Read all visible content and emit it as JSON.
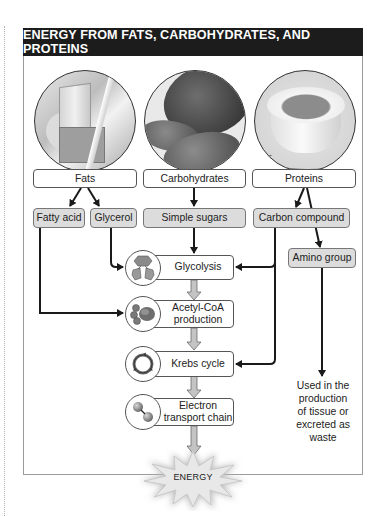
{
  "title": "ENERGY FROM FATS, CARBOHYDRATES, AND PROTEINS",
  "sources": [
    {
      "label": "Fats",
      "image": "butter-photo"
    },
    {
      "label": "Carbohydrates",
      "image": "bread-photo"
    },
    {
      "label": "Proteins",
      "image": "egg-photo"
    }
  ],
  "intermediates": {
    "fatty_acid": "Fatty acid",
    "glycerol": "Glycerol",
    "simple_sugars": "Simple sugars",
    "carbon_compound": "Carbon compound",
    "amino_group": "Amino group"
  },
  "process_steps": [
    {
      "label": "Glycolysis",
      "icon": "glycolysis-icon"
    },
    {
      "label_line1": "Acetyl-CoA",
      "label_line2": "production",
      "icon": "acetyl-coa-icon"
    },
    {
      "label": "Krebs cycle",
      "icon": "krebs-cycle-icon"
    },
    {
      "label_line1": "Electron",
      "label_line2": "transport chain",
      "icon": "electron-transport-icon"
    }
  ],
  "amino_outcome": {
    "line1": "Used in the",
    "line2": "production",
    "line3": "of tissue or",
    "line4": "excreted as",
    "line5": "waste"
  },
  "output": "ENERGY",
  "colors": {
    "title_bar": "#1c1c1c",
    "gray_box": "#dcdcdc",
    "arrow": "#1a1a1a",
    "process_arrow": "#a8a8a8"
  }
}
